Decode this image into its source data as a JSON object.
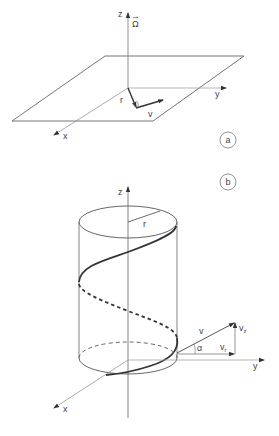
{
  "figure_a": {
    "panel_label": "a",
    "axes": {
      "z": "z",
      "y": "y",
      "x": "x"
    },
    "vectors": {
      "omega": "Ω",
      "r": "r",
      "v": "v"
    }
  },
  "figure_b": {
    "panel_label": "b",
    "axes": {
      "z": "z",
      "y": "y",
      "x": "x"
    },
    "radius_label": "r",
    "vectors": {
      "v": "v",
      "vz": "v",
      "vz_sub": "z",
      "vr": "v",
      "vr_sub": "r"
    },
    "angle_label": "α"
  },
  "colors": {
    "line": "#555555",
    "helix": "#333333",
    "background": "#ffffff"
  }
}
